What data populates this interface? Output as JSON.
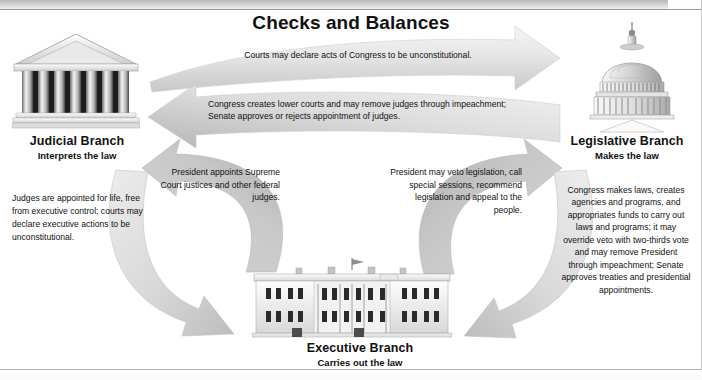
{
  "title": "Checks and Balances",
  "branches": {
    "judicial": {
      "name": "Judicial Branch",
      "role": "Interprets the law",
      "icon": "courthouse-icon"
    },
    "legislative": {
      "name": "Legislative Branch",
      "role": "Makes the law",
      "icon": "capitol-dome-icon"
    },
    "executive": {
      "name": "Executive Branch",
      "role": "Carries out the law",
      "icon": "white-house-icon"
    }
  },
  "arrows": {
    "judicial_to_legislative": {
      "label": "Courts may declare acts of Congress to be unconstitutional.",
      "direction": "right"
    },
    "legislative_to_judicial": {
      "label": "Congress creates lower courts and may remove judges through impeachment;  Senate approves or rejects appointment of judges.",
      "direction": "left"
    },
    "judicial_to_executive": {
      "label": "Judges are appointed for life, free from executive control; courts may declare executive actions to be unconstitutional.",
      "direction": "down-right"
    },
    "executive_to_judicial": {
      "label": "President appoints Supreme Court justices and other federal judges.",
      "direction": "up-left"
    },
    "executive_to_legislative": {
      "label": "President may veto legislation, call special sessions, recommend legislation and appeal to the people.",
      "direction": "up-right"
    },
    "legislative_to_executive": {
      "label": "Congress makes laws, creates agencies and programs, and appropriates funds to carry out laws and programs; it may override veto with two-thirds vote and may remove President through impeachment; Senate approves treaties and presidential appointments.",
      "direction": "down-left"
    }
  },
  "colors": {
    "arrow_fill_light": "#e2e2e2",
    "arrow_fill_dark": "#b6b6b6",
    "text": "#111111",
    "background": "#ffffff"
  }
}
